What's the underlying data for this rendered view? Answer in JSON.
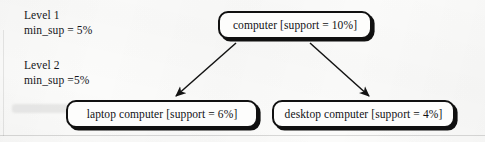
{
  "figure": {
    "kind": "concept-hierarchy-diagram",
    "colors": {
      "background": "#fbfbfa",
      "node_fill": "#fdfdfc",
      "node_border": "#111111",
      "node_shadow": "#101010",
      "text": "#15161a",
      "arrow": "#131313"
    }
  },
  "levels": [
    {
      "title": "Level 1",
      "min_sup": "min_sup = 5%"
    },
    {
      "title": "Level 2",
      "min_sup": "min_sup =5%"
    }
  ],
  "nodes": [
    {
      "id": "computer",
      "label": "computer [support = 10%]",
      "item": "computer",
      "support": "10%"
    },
    {
      "id": "laptop",
      "label": "laptop computer [support = 6%]",
      "item": "laptop computer",
      "support": "6%"
    },
    {
      "id": "desktop",
      "label": "desktop computer [support = 4%]",
      "item": "desktop computer",
      "support": "4%"
    }
  ],
  "edges": [
    {
      "from": "computer",
      "to": "laptop",
      "arrow": "arrow-computer-to-laptop"
    },
    {
      "from": "computer",
      "to": "desktop",
      "arrow": "arrow-computer-to-desktop"
    }
  ]
}
